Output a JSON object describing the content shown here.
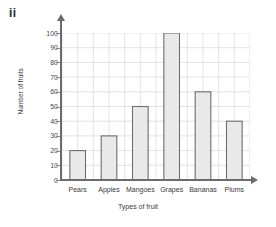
{
  "figure": {
    "label": "ii"
  },
  "chart_data": {
    "type": "bar",
    "title": "",
    "categories": [
      "Pears",
      "Apples",
      "Mangoes",
      "Grapes",
      "Bananas",
      "Plums"
    ],
    "values": [
      20,
      30,
      50,
      100,
      60,
      40
    ],
    "xlabel": "Types of fruit",
    "ylabel": "Number of fruits",
    "ylim": [
      0,
      100
    ],
    "ytick_step": 10,
    "yticks": [
      0,
      10,
      20,
      30,
      40,
      50,
      60,
      70,
      80,
      90,
      100
    ],
    "ytick_labels": [
      "0",
      "10",
      "20",
      "30",
      "40",
      "50",
      "60",
      "70",
      "80",
      "90",
      "100"
    ],
    "grid": true,
    "legend": false,
    "bar_fill": "#e9e9e9",
    "bar_stroke": "#6e6e6e",
    "grid_color": "#dcdcdc",
    "axis_color": "#6b6b6b"
  }
}
